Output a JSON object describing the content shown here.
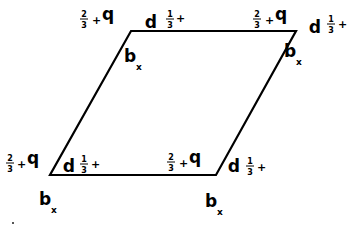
{
  "diagram": {
    "shape": "parallelogram",
    "vertices": {
      "top_left": [
        131,
        31
      ],
      "top_right": [
        296,
        31
      ],
      "bottom_right": [
        216,
        175
      ],
      "bottom_left": [
        50,
        175
      ]
    },
    "stroke_color": "#000000",
    "background": "#ffffff",
    "label_groups": [
      {
        "id": "tl",
        "q_label": {
          "frac_num": "2",
          "frac_den": "3",
          "plus": "+",
          "letter": "q"
        },
        "p_label": {
          "letter": "p",
          "frac_num": "1",
          "frac_den": "3",
          "plus": "+"
        },
        "b_label": {
          "letter": "b",
          "sub": "x"
        }
      },
      {
        "id": "tr",
        "q_label": {
          "frac_num": "2",
          "frac_den": "3",
          "plus": "+",
          "letter": "q"
        },
        "p_label": {
          "letter": "p",
          "frac_num": "1",
          "frac_den": "3",
          "plus": "+"
        },
        "b_label": {
          "letter": "b",
          "sub": "x"
        }
      },
      {
        "id": "bl",
        "q_label": {
          "frac_num": "2",
          "frac_den": "3",
          "plus": "+",
          "letter": "q"
        },
        "p_label": {
          "letter": "p",
          "frac_num": "1",
          "frac_den": "3",
          "plus": "+"
        },
        "b_label": {
          "letter": "b",
          "sub": "x"
        }
      },
      {
        "id": "br",
        "q_label": {
          "frac_num": "2",
          "frac_den": "3",
          "plus": "+",
          "letter": "q"
        },
        "p_label": {
          "letter": "p",
          "frac_num": "1",
          "frac_den": "3",
          "plus": "+"
        },
        "b_label": {
          "letter": "b",
          "sub": "x"
        }
      }
    ]
  }
}
